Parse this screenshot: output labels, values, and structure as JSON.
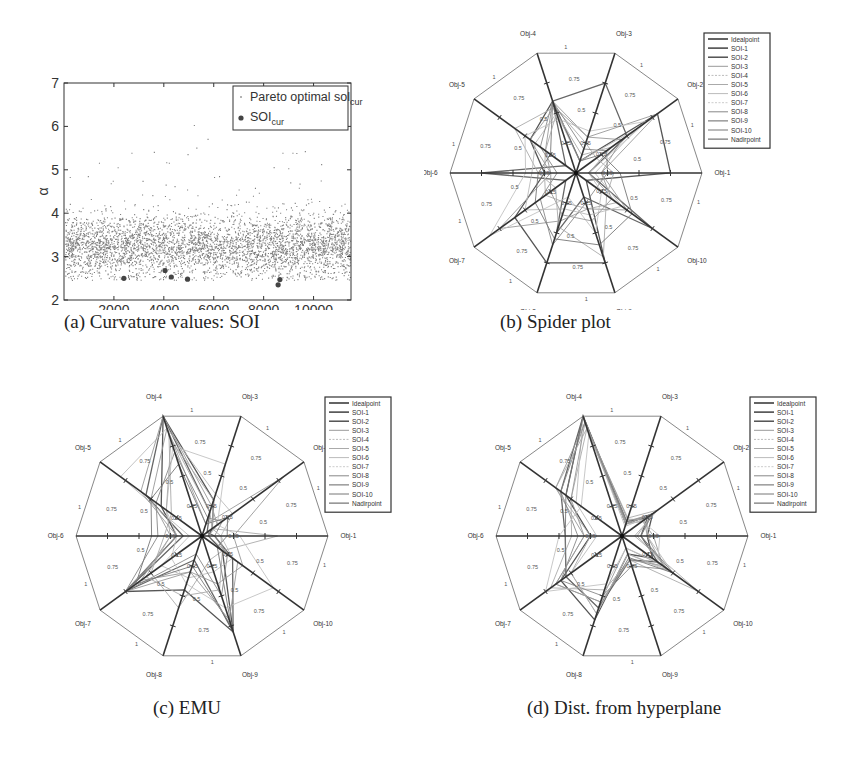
{
  "figure": {
    "captions": {
      "a": "(a) Curvature values: SOI",
      "b": "(b) Spider plot",
      "c": "(c) EMU",
      "d": "(d) Dist. from hyperplane"
    }
  },
  "chart_data": [
    {
      "id": "a",
      "type": "scatter",
      "title": "",
      "xlabel": "Sol ID",
      "ylabel": "α",
      "xlim": [
        0,
        11500
      ],
      "ylim": [
        2,
        7
      ],
      "xticks": [
        2000,
        4000,
        6000,
        8000,
        10000
      ],
      "yticks": [
        2,
        3,
        4,
        5,
        6,
        7
      ],
      "grid": false,
      "legend_position": "upper right",
      "series": [
        {
          "name": "Pareto optimal sol_cur",
          "marker": "dot",
          "description": "~11500 points, dense band centered near α≈3.2 (range mostly 2.6–4.2), sparse outliers up to ≈6.0",
          "band_center": 3.25,
          "band_spread": 0.35,
          "n_points": 11500,
          "outliers": [
            [
              5200,
              6.02
            ],
            [
              5750,
              5.7
            ],
            [
              1400,
              5.15
            ],
            [
              2700,
              5.38
            ],
            [
              3600,
              5.4
            ],
            [
              4200,
              5.15
            ],
            [
              4950,
              5.35
            ],
            [
              5300,
              5.5
            ],
            [
              9650,
              5.42
            ],
            [
              9150,
              5.38
            ],
            [
              8400,
              5.05
            ],
            [
              10300,
              5.12
            ],
            [
              8750,
              5.38
            ]
          ]
        },
        {
          "name": "SOI_cur",
          "marker": "circle",
          "points": [
            [
              2400,
              2.5
            ],
            [
              4050,
              2.68
            ],
            [
              4300,
              2.53
            ],
            [
              4950,
              2.48
            ],
            [
              8580,
              2.35
            ],
            [
              8650,
              2.47
            ]
          ]
        }
      ]
    },
    {
      "id": "b",
      "type": "radar",
      "title": "Spider plot",
      "axes": [
        "Obj-1",
        "Obj-2",
        "Obj-3",
        "Obj-4",
        "Obj-5",
        "Obj-6",
        "Obj-7",
        "Obj-8",
        "Obj-9",
        "Obj-10"
      ],
      "ring_labels": [
        "0.25",
        "0.5",
        "0.75",
        "1"
      ],
      "legend": [
        "Idealpoint",
        "SOI-1",
        "SOI-2",
        "SOI-3",
        "SOI-4",
        "SOI-5",
        "SOI-6",
        "SOI-7",
        "SOI-8",
        "SOI-9",
        "SOI-10",
        "Nadirpoint"
      ],
      "series": [
        {
          "name": "SOI-1",
          "values": [
            0.75,
            0.8,
            0.1,
            0.6,
            0.45,
            0.25,
            0.6,
            0.75,
            0.75,
            0.1
          ]
        },
        {
          "name": "SOI-2",
          "values": [
            0.1,
            0.5,
            0.75,
            0.6,
            0.1,
            0.75,
            0.1,
            0.5,
            0.2,
            0.75
          ]
        },
        {
          "name": "SOI-3",
          "values": [
            0.2,
            0.8,
            0.3,
            0.6,
            0.3,
            0.2,
            0.75,
            0.4,
            0.3,
            0.5
          ]
        },
        {
          "name": "SOI-4",
          "values": [
            0.3,
            0.2,
            0.25,
            0.55,
            0.6,
            0.3,
            0.2,
            0.45,
            0.7,
            0.3
          ]
        },
        {
          "name": "SOI-5",
          "values": [
            0.15,
            0.6,
            0.1,
            0.5,
            0.4,
            0.35,
            0.5,
            0.3,
            0.35,
            0.45
          ]
        },
        {
          "name": "SOI-6",
          "values": [
            0.25,
            0.3,
            0.2,
            0.6,
            0.35,
            0.15,
            0.35,
            0.6,
            0.25,
            0.2
          ]
        },
        {
          "name": "SOI-7",
          "values": [
            0.1,
            0.7,
            0.35,
            0.45,
            0.5,
            0.4,
            0.85,
            0.2,
            0.5,
            0.25
          ]
        },
        {
          "name": "SOI-8",
          "values": [
            0.35,
            0.25,
            0.1,
            0.6,
            0.25,
            0.3,
            0.4,
            0.55,
            0.6,
            0.55
          ]
        },
        {
          "name": "SOI-9",
          "values": [
            0.2,
            0.45,
            0.3,
            0.55,
            0.45,
            0.2,
            0.25,
            0.35,
            0.4,
            0.35
          ]
        },
        {
          "name": "SOI-10",
          "values": [
            0.1,
            0.35,
            0.15,
            0.5,
            0.3,
            0.25,
            0.3,
            0.25,
            0.3,
            0.4
          ]
        }
      ]
    },
    {
      "id": "c",
      "type": "radar",
      "title": "EMU",
      "axes": [
        "Obj-1",
        "Obj-2",
        "Obj-3",
        "Obj-4",
        "Obj-5",
        "Obj-6",
        "Obj-7",
        "Obj-8",
        "Obj-9",
        "Obj-10"
      ],
      "ring_labels": [
        "0.25",
        "0.5",
        "0.75",
        "1"
      ],
      "legend": [
        "Idealpoint",
        "SOI-1",
        "SOI-2",
        "SOI-3",
        "SOI-4",
        "SOI-5",
        "SOI-6",
        "SOI-7",
        "SOI-8",
        "SOI-9",
        "SOI-10",
        "Nadirpoint"
      ],
      "series": [
        {
          "name": "SOI-1",
          "values": [
            0.05,
            0.1,
            0.3,
            1.0,
            0.4,
            0.2,
            0.75,
            0.45,
            0.8,
            0.2
          ]
        },
        {
          "name": "SOI-2",
          "values": [
            0.1,
            0.05,
            0.2,
            1.0,
            0.55,
            0.15,
            0.75,
            0.2,
            0.8,
            0.3
          ]
        },
        {
          "name": "SOI-3",
          "values": [
            0.25,
            0.8,
            0.1,
            0.9,
            0.5,
            0.25,
            0.6,
            0.3,
            0.4,
            0.4
          ]
        },
        {
          "name": "SOI-4",
          "values": [
            0.6,
            0.1,
            0.2,
            0.85,
            0.3,
            0.3,
            0.5,
            0.6,
            0.2,
            0.2
          ]
        },
        {
          "name": "SOI-5",
          "values": [
            0.15,
            0.3,
            0.35,
            0.9,
            0.8,
            0.1,
            0.4,
            0.35,
            0.3,
            0.3
          ]
        },
        {
          "name": "SOI-6",
          "values": [
            0.1,
            0.2,
            0.15,
            0.7,
            0.45,
            0.35,
            0.75,
            0.15,
            0.5,
            0.25
          ]
        },
        {
          "name": "SOI-7",
          "values": [
            0.3,
            0.15,
            0.6,
            0.75,
            0.35,
            0.2,
            0.3,
            0.4,
            0.6,
            0.7
          ]
        },
        {
          "name": "SOI-8",
          "values": [
            0.2,
            0.25,
            0.1,
            0.6,
            0.5,
            0.4,
            0.65,
            0.25,
            0.75,
            0.15
          ]
        },
        {
          "name": "SOI-9",
          "values": [
            0.05,
            0.15,
            0.25,
            1.0,
            0.6,
            0.2,
            0.75,
            0.3,
            0.7,
            0.35
          ]
        },
        {
          "name": "SOI-10",
          "values": [
            0.15,
            0.1,
            0.3,
            0.8,
            0.35,
            0.25,
            0.55,
            0.5,
            0.45,
            0.2
          ]
        }
      ]
    },
    {
      "id": "d",
      "type": "radar",
      "title": "Dist. from hyperplane",
      "axes": [
        "Obj-1",
        "Obj-2",
        "Obj-3",
        "Obj-4",
        "Obj-5",
        "Obj-6",
        "Obj-7",
        "Obj-8",
        "Obj-9",
        "Obj-10"
      ],
      "ring_labels": [
        "0.25",
        "0.5",
        "0.75",
        "1"
      ],
      "legend": [
        "Idealpoint",
        "SOI-1",
        "SOI-2",
        "SOI-3",
        "SOI-4",
        "SOI-5",
        "SOI-6",
        "SOI-7",
        "SOI-8",
        "SOI-9",
        "SOI-10",
        "Nadirpoint"
      ],
      "series": [
        {
          "name": "SOI-1",
          "values": [
            0.2,
            0.3,
            0.1,
            1.0,
            0.55,
            0.25,
            0.6,
            0.7,
            0.15,
            0.3
          ]
        },
        {
          "name": "SOI-2",
          "values": [
            0.15,
            0.25,
            0.12,
            1.0,
            0.6,
            0.45,
            0.55,
            0.6,
            0.2,
            0.35
          ]
        },
        {
          "name": "SOI-3",
          "values": [
            0.25,
            0.2,
            0.1,
            0.95,
            0.65,
            0.3,
            0.65,
            0.55,
            0.1,
            0.4
          ]
        },
        {
          "name": "SOI-4",
          "values": [
            0.1,
            0.35,
            0.15,
            0.9,
            0.5,
            0.4,
            0.7,
            0.45,
            0.2,
            0.75
          ]
        },
        {
          "name": "SOI-5",
          "values": [
            0.2,
            0.25,
            0.08,
            1.0,
            0.45,
            0.2,
            0.5,
            0.65,
            0.15,
            0.5
          ]
        },
        {
          "name": "SOI-6",
          "values": [
            0.15,
            0.3,
            0.12,
            0.95,
            0.6,
            0.35,
            0.6,
            0.5,
            0.25,
            0.45
          ]
        },
        {
          "name": "SOI-7",
          "values": [
            0.3,
            0.2,
            0.1,
            0.85,
            0.4,
            0.5,
            0.75,
            0.4,
            0.1,
            0.35
          ]
        },
        {
          "name": "SOI-8",
          "values": [
            0.15,
            0.28,
            0.1,
            1.0,
            0.55,
            0.45,
            0.55,
            0.6,
            0.18,
            0.5
          ]
        },
        {
          "name": "SOI-9",
          "values": [
            0.2,
            0.22,
            0.14,
            0.95,
            0.5,
            0.3,
            0.65,
            0.55,
            0.2,
            0.4
          ]
        },
        {
          "name": "SOI-10",
          "values": [
            0.12,
            0.3,
            0.1,
            0.9,
            0.65,
            0.25,
            0.5,
            0.65,
            0.15,
            0.45
          ]
        }
      ]
    }
  ]
}
